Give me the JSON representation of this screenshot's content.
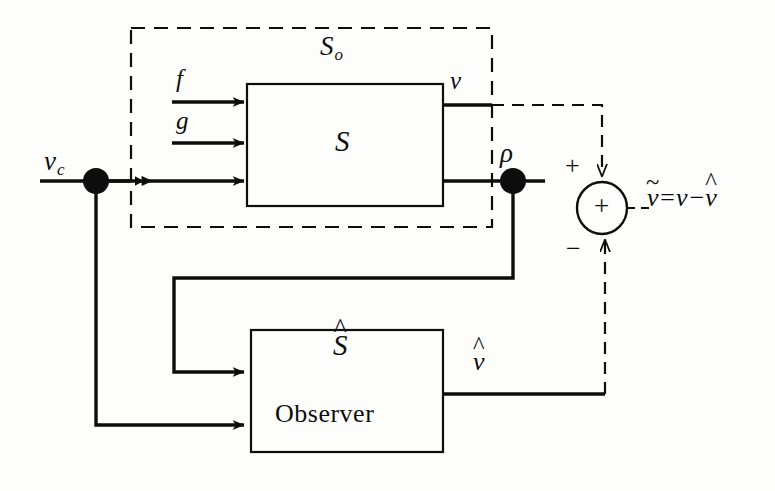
{
  "diagram": {
    "colors": {
      "ink": "#0d0d0d",
      "background": "#fdfdfc"
    },
    "outer_boundary": {
      "label": "S",
      "label_subscript": "o",
      "style": "dashed"
    },
    "blocks": [
      {
        "name": "plant",
        "label": "S",
        "sublabel": ""
      },
      {
        "name": "observer",
        "label": "S",
        "accent": "^",
        "sublabel": "Observer"
      }
    ],
    "signals": {
      "command_input": "v",
      "command_input_subscript": "c",
      "disturbance_f": "f",
      "disturbance_g": "g",
      "output_v": "v",
      "measurement_rho": "ρ",
      "estimate_vhat": "v",
      "error_symbol": "v"
    },
    "summing_junction": {
      "name": "summing-junction",
      "interior_sign": "+",
      "top_input_sign": "+",
      "bottom_input_sign": "−",
      "output_equation": {
        "lhs_base": "v",
        "lhs_accent": "~",
        "equals": "=",
        "rhs_first": "v",
        "operator": "−",
        "rhs_second_base": "v",
        "rhs_second_accent": "^"
      }
    }
  }
}
